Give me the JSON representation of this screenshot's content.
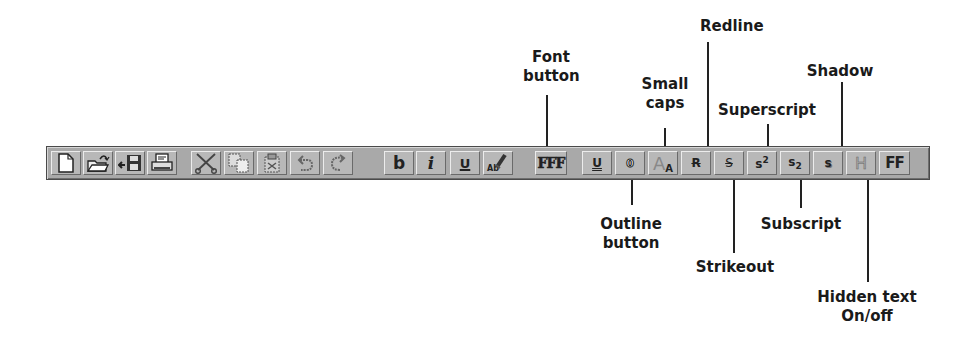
{
  "toolbar": {
    "buttons": [
      {
        "id": "new-document",
        "icon": "new-document-icon",
        "label": ""
      },
      {
        "id": "open",
        "icon": "open-folder-icon",
        "label": ""
      },
      {
        "id": "save",
        "icon": "save-disk-icon",
        "label": ""
      },
      {
        "id": "print",
        "icon": "printer-icon",
        "label": ""
      },
      {
        "id": "cut",
        "icon": "scissors-icon",
        "label": ""
      },
      {
        "id": "copy",
        "icon": "copy-icon",
        "label": ""
      },
      {
        "id": "paste",
        "icon": "paste-icon",
        "label": ""
      },
      {
        "id": "undo",
        "icon": "undo-icon",
        "label": ""
      },
      {
        "id": "redo",
        "icon": "redo-icon",
        "label": ""
      },
      {
        "id": "bold",
        "icon": "bold-icon",
        "label": "b"
      },
      {
        "id": "italic",
        "icon": "italic-icon",
        "label": "i"
      },
      {
        "id": "underline",
        "icon": "underline-icon",
        "label": "U"
      },
      {
        "id": "format-painter",
        "icon": "format-painter-icon",
        "label": "Ab"
      },
      {
        "id": "font",
        "icon": "font-icon",
        "label": "FFF"
      },
      {
        "id": "double-underline",
        "icon": "double-underline-icon",
        "label": "U"
      },
      {
        "id": "outline",
        "icon": "outline-icon",
        "label": "0"
      },
      {
        "id": "small-caps",
        "icon": "small-caps-icon",
        "label": "AA"
      },
      {
        "id": "redline",
        "icon": "redline-icon",
        "label": "R"
      },
      {
        "id": "strikeout",
        "icon": "strikeout-icon",
        "label": "S"
      },
      {
        "id": "superscript",
        "icon": "superscript-icon",
        "label": "s2"
      },
      {
        "id": "subscript",
        "icon": "subscript-icon",
        "label": "s2"
      },
      {
        "id": "shadow",
        "icon": "shadow-icon",
        "label": "s"
      },
      {
        "id": "hidden-text",
        "icon": "hidden-text-icon",
        "label": "H"
      },
      {
        "id": "ff",
        "icon": "ff-icon",
        "label": "FF"
      }
    ]
  },
  "callouts": {
    "font_button": {
      "line1": "Font",
      "line2": "button"
    },
    "small_caps": {
      "line1": "Small",
      "line2": "caps"
    },
    "redline": {
      "line1": "Redline"
    },
    "superscript": {
      "line1": "Superscript"
    },
    "shadow": {
      "line1": "Shadow"
    },
    "outline_button": {
      "line1": "Outline",
      "line2": "button"
    },
    "strikeout": {
      "line1": "Strikeout"
    },
    "subscript": {
      "line1": "Subscript"
    },
    "hidden_text": {
      "line1": "Hidden text",
      "line2": "On/off"
    }
  },
  "colors": {
    "toolbar_bg": "#a9a9a9",
    "button_face": "#b8b8b8",
    "text": "#1a1a1a"
  }
}
